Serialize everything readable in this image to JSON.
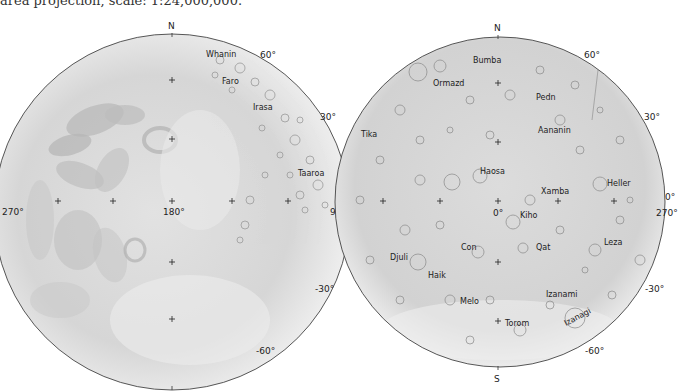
{
  "caption": "area projection, scale: 1:24,000,000.",
  "left_hemisphere": {
    "center": [
      172,
      212
    ],
    "radius": 178,
    "pole_north": "N",
    "pole_south": "S",
    "longitude_labels": {
      "left": "270°",
      "center": "180°",
      "right": "90°"
    },
    "latitude_labels": [
      "60°",
      "30°",
      "-30°",
      "-60°"
    ],
    "features": [
      {
        "name": "Whanin",
        "x": 201,
        "y": 57
      },
      {
        "name": "Faro",
        "x": 222,
        "y": 84
      },
      {
        "name": "Irasa",
        "x": 253,
        "y": 110
      },
      {
        "name": "Taaroa",
        "x": 300,
        "y": 176
      }
    ]
  },
  "right_hemisphere": {
    "center": [
      500,
      202
    ],
    "radius": 165,
    "pole_north": "N",
    "pole_south": "S",
    "longitude_labels": {
      "center": "0°",
      "right_upper": "0°",
      "right_lower": "270°",
      "left": "90°"
    },
    "latitude_labels": [
      "60°",
      "30°",
      "-30°",
      "-60°"
    ],
    "features": [
      {
        "name": "Bumba",
        "x": 473,
        "y": 63
      },
      {
        "name": "Ormazd",
        "x": 433,
        "y": 86
      },
      {
        "name": "Pedn",
        "x": 536,
        "y": 100
      },
      {
        "name": "Tika",
        "x": 361,
        "y": 137
      },
      {
        "name": "Aananin",
        "x": 538,
        "y": 133
      },
      {
        "name": "Haosa",
        "x": 480,
        "y": 174
      },
      {
        "name": "Xamba",
        "x": 541,
        "y": 194
      },
      {
        "name": "Heller",
        "x": 607,
        "y": 186
      },
      {
        "name": "Kiho",
        "x": 520,
        "y": 218
      },
      {
        "name": "Con",
        "x": 461,
        "y": 250
      },
      {
        "name": "Qat",
        "x": 536,
        "y": 250
      },
      {
        "name": "Djuli",
        "x": 390,
        "y": 260
      },
      {
        "name": "Leza",
        "x": 604,
        "y": 245
      },
      {
        "name": "Haik",
        "x": 428,
        "y": 278
      },
      {
        "name": "Melo",
        "x": 460,
        "y": 304
      },
      {
        "name": "Izanami",
        "x": 546,
        "y": 297
      },
      {
        "name": "Torom",
        "x": 505,
        "y": 326
      },
      {
        "name": "Izanagi",
        "x": 568,
        "y": 322
      }
    ]
  }
}
